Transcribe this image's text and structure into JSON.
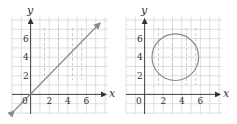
{
  "figures": [
    {
      "id": "left",
      "description": "Graph of the line y = x",
      "x_axis_label": "x",
      "y_axis_label": "y",
      "x_ticks": [
        "2",
        "4",
        "6"
      ],
      "y_ticks": [
        "2",
        "4",
        "6"
      ],
      "origin_label": "0",
      "curve": "line y = x with arrows on both ends",
      "dashed_verticals_x": [
        1.5,
        3,
        4.5,
        5.5
      ]
    },
    {
      "id": "right",
      "description": "Graph of a circle",
      "x_axis_label": "x",
      "y_axis_label": "y",
      "x_ticks": [
        "2",
        "4",
        "6"
      ],
      "y_ticks": [
        "2",
        "4",
        "6"
      ],
      "origin_label": "0",
      "curve": "circle centered approx (3.3, 4), radius approx 2.5",
      "dashed_verticals_x": [
        1.5,
        3,
        4.5,
        5.5
      ]
    }
  ],
  "colors": {
    "grid": "#d6d6d6",
    "axis": "#444444",
    "curve": "#8a8a8a",
    "dashed": "#bdbdbd"
  }
}
